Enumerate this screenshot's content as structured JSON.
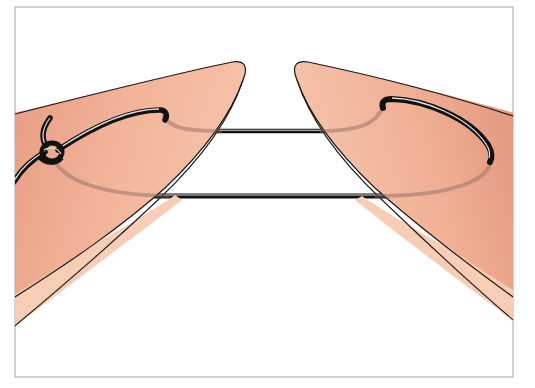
{
  "figure": {
    "description": "Medical illustration of a suture passing across a wound gap between two skin flaps, tied with a knot on the left flap",
    "colors": {
      "background": "#ffffff",
      "frame": "#b4b4b4",
      "skin_light": "#f6c4ab",
      "skin_mid": "#eea78a",
      "skin_dark": "#e0907a",
      "skin_band": "#f7cdb5",
      "outline": "#1a1a1a",
      "suture": "#111111",
      "suture_highlight": "#d9d9d9",
      "buried_suture": "#8a6a60"
    },
    "elements": {
      "left_flap": "left-skin-flap",
      "right_flap": "right-skin-flap",
      "upper_suture": "upper-suture-strand",
      "lower_suture": "lower-suture-strand",
      "knot": "suture-knot"
    }
  }
}
